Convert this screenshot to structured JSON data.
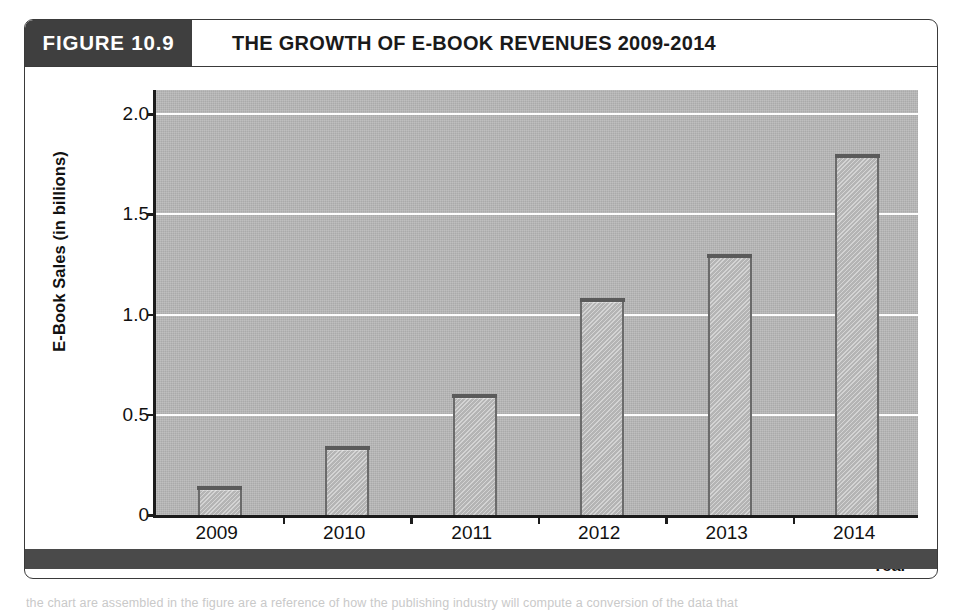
{
  "figure": {
    "badge_label": "FIGURE 10.9",
    "title": "THE GROWTH OF E-BOOK REVENUES 2009-2014"
  },
  "colors": {
    "badge_background": "#3f3f3f",
    "frame_border": "#3a3a3a",
    "plot_background": "#b9b9b9",
    "gridline": "#fdfdfd",
    "bar_fill": "#c2c2c2",
    "bar_outline": "#6b6b6b",
    "axis": "#1c1c1c",
    "footer_band": "#4a4a4a"
  },
  "page_text_fragment": "the chart are assembled in the figure are a reference of how the publishing industry will compute a conversion of the data that",
  "chart_data": {
    "type": "bar",
    "title": "THE GROWTH OF E-BOOK REVENUES 2009-2014",
    "xlabel": "Year",
    "ylabel": "E-Book Sales (in billions)",
    "categories": [
      "2009",
      "2010",
      "2011",
      "2012",
      "2013",
      "2014"
    ],
    "values": [
      0.14,
      0.34,
      0.6,
      1.08,
      1.3,
      1.8
    ],
    "ylim": [
      0,
      2.12
    ],
    "yticks": [
      0,
      0.5,
      1.0,
      1.5,
      2.0
    ],
    "ytick_labels": [
      "0",
      "0.5",
      "1.0",
      "1.5",
      "2.0"
    ],
    "grid": "horizontal",
    "legend": "none"
  }
}
